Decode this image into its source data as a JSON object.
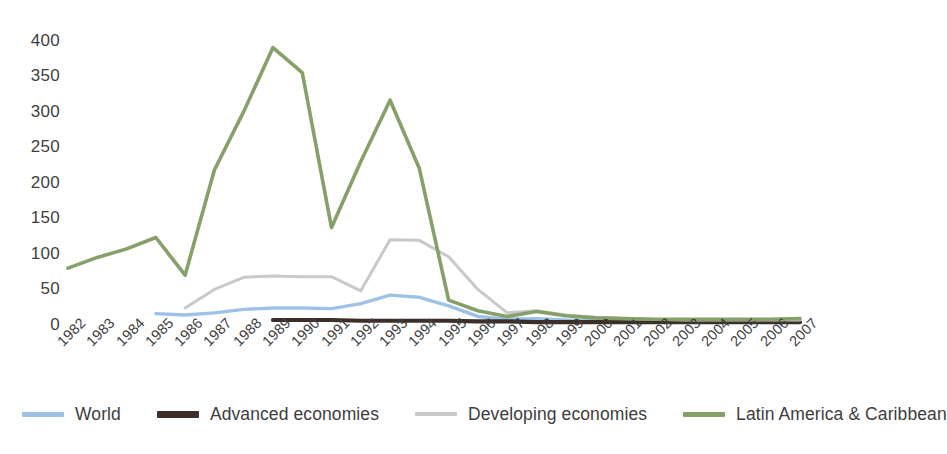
{
  "chart_data": {
    "type": "line",
    "title": "",
    "xlabel": "",
    "ylabel": "",
    "ylim": [
      0,
      400
    ],
    "yticks": [
      0,
      50,
      100,
      150,
      200,
      250,
      300,
      350,
      400
    ],
    "grid": false,
    "legend_position": "bottom",
    "categories": [
      "1982",
      "1983",
      "1984",
      "1985",
      "1986",
      "1987",
      "1988",
      "1989",
      "1990",
      "1991",
      "1992",
      "1993",
      "1994",
      "1995",
      "1996",
      "1997",
      "1998",
      "1999",
      "2000",
      "2001",
      "2002",
      "2003",
      "2004",
      "2005",
      "2006",
      "2007"
    ],
    "series": [
      {
        "name": "World",
        "color": "#9CC3E5",
        "values": [
          null,
          null,
          null,
          16,
          14,
          17,
          22,
          24,
          24,
          23,
          30,
          42,
          39,
          27,
          12,
          8,
          9,
          7,
          6,
          5,
          5,
          5,
          5,
          5,
          5,
          5
        ]
      },
      {
        "name": "Advanced economies",
        "color": "#3C2F2A",
        "values": [
          null,
          null,
          null,
          null,
          null,
          null,
          null,
          7,
          7,
          7,
          6,
          6,
          6,
          6,
          5,
          5,
          4,
          4,
          4,
          4,
          4,
          4,
          4,
          4,
          4,
          4
        ]
      },
      {
        "name": "Developing economies",
        "color": "#C9C9C9",
        "values": [
          null,
          null,
          null,
          null,
          24,
          50,
          67,
          69,
          68,
          68,
          48,
          120,
          119,
          96,
          50,
          17,
          20,
          14,
          11,
          9,
          8,
          7,
          7,
          7,
          7,
          7
        ]
      },
      {
        "name": "Latin America & Caribbean",
        "color": "#85A169",
        "values": [
          80,
          95,
          107,
          123,
          70,
          218,
          300,
          390,
          355,
          137,
          230,
          316,
          220,
          35,
          20,
          12,
          19,
          13,
          10,
          9,
          8,
          8,
          8,
          8,
          8,
          9
        ]
      }
    ]
  },
  "legend": {
    "items": [
      {
        "label": "World",
        "swatch_name": "legend-swatch-world"
      },
      {
        "label": "Advanced economies",
        "swatch_name": "legend-swatch-advanced-economies"
      },
      {
        "label": "Developing economies",
        "swatch_name": "legend-swatch-developing-economies"
      },
      {
        "label": "Latin America & Caribbean",
        "swatch_name": "legend-swatch-latin-america-caribbean"
      }
    ]
  }
}
